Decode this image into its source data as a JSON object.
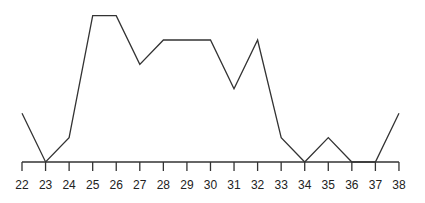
{
  "chart_data": {
    "type": "line",
    "title": "",
    "xlabel": "",
    "ylabel": "",
    "x": [
      22,
      23,
      24,
      25,
      26,
      27,
      28,
      29,
      30,
      31,
      32,
      33,
      34,
      35,
      36,
      37,
      38
    ],
    "values": [
      2,
      0,
      1,
      6,
      6,
      4,
      5,
      5,
      5,
      3,
      5,
      1,
      0,
      1,
      0,
      0,
      2
    ],
    "tick_labels": [
      "22",
      "23",
      "24",
      "25",
      "26",
      "27",
      "28",
      "29",
      "30",
      "31",
      "32",
      "33",
      "34",
      "35",
      "36",
      "37",
      "38"
    ],
    "ylim": [
      0,
      6
    ],
    "grid": false,
    "legend": null
  },
  "style": {
    "line_color": "#333333",
    "axis_color": "#333333",
    "background": "#ffffff"
  }
}
